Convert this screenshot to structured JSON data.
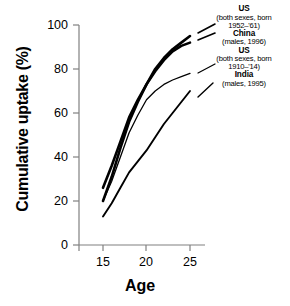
{
  "chart_data": {
    "type": "line",
    "title": "",
    "xlabel": "Age",
    "ylabel": "Cumulative uptake (%)",
    "xlim": [
      13.5,
      26.5
    ],
    "ylim": [
      0,
      100
    ],
    "xticks": [
      15,
      20,
      25
    ],
    "yticks": [
      0,
      20,
      40,
      60,
      80,
      100
    ],
    "grid": false,
    "legend_position": "right",
    "series": [
      {
        "name": "US (both sexes, born 1952-'61)",
        "label_title": "US",
        "label_sub_1": "(both sexes, born",
        "label_sub_2": "1952–'61)",
        "linewidth": 2.6,
        "x": [
          15,
          16,
          17,
          18,
          19,
          20,
          21,
          22,
          23,
          24,
          25
        ],
        "y": [
          26,
          36,
          47,
          58,
          66,
          73,
          80,
          85,
          89,
          92,
          95
        ]
      },
      {
        "name": "China (males, 1996)",
        "label_title": "China",
        "label_sub_1": "(males, 1996)",
        "label_sub_2": "",
        "linewidth": 2.6,
        "x": [
          15,
          16,
          17,
          18,
          19,
          20,
          21,
          22,
          23,
          24,
          25
        ],
        "y": [
          20,
          31,
          44,
          56,
          65,
          73,
          79,
          84,
          88,
          90.5,
          92
        ]
      },
      {
        "name": "US (both sexes, born 1910-'14)",
        "label_title": "US",
        "label_sub_1": "(both sexes, born",
        "label_sub_2": "1910–'14)",
        "linewidth": 1.3,
        "x": [
          15,
          16,
          17,
          18,
          19,
          20,
          21,
          22,
          23,
          24,
          25
        ],
        "y": [
          20,
          29,
          40,
          51,
          59,
          66,
          70,
          73,
          75,
          76.5,
          78
        ]
      },
      {
        "name": "India (males, 1995)",
        "label_title": "India",
        "label_sub_1": "(males, 1995)",
        "label_sub_2": "",
        "linewidth": 1.9,
        "x": [
          15,
          16,
          17,
          18,
          19,
          20,
          21,
          22,
          23,
          24,
          25
        ],
        "y": [
          13,
          19,
          26,
          33,
          38,
          43,
          49,
          55,
          60,
          65,
          70
        ]
      }
    ]
  },
  "axes": {
    "y_tick_labels": [
      "100",
      "80",
      "60",
      "40",
      "20",
      "0"
    ],
    "x_tick_labels": [
      "15",
      "20",
      "25"
    ],
    "x_axis_title": "Age",
    "y_axis_title": "Cumulative uptake (%)"
  },
  "legend": {
    "entries": [
      {
        "title": "US",
        "sub1": "(both sexes, born",
        "sub2": "1952–'61)"
      },
      {
        "title": "China",
        "sub1": "(males, 1996)",
        "sub2": ""
      },
      {
        "title": "US",
        "sub1": "(both sexes, born",
        "sub2": "1910–'14)"
      },
      {
        "title": "India",
        "sub1": "(males, 1995)",
        "sub2": ""
      }
    ]
  },
  "colors": {
    "line": "#000000",
    "axis": "#808080",
    "background": "#ffffff",
    "text": "#000000"
  }
}
